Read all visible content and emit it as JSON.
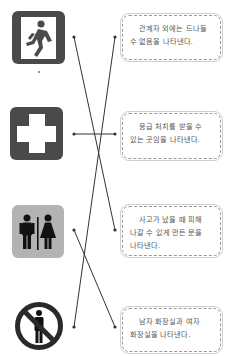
{
  "signs": [
    {
      "name": "emergency-exit",
      "icon": "running-person-exit-icon",
      "bg": "#4a4a4a"
    },
    {
      "name": "first-aid",
      "icon": "white-cross-icon",
      "bg": "#4a4a4a"
    },
    {
      "name": "restroom",
      "icon": "man-woman-restroom-icon",
      "bg": "#b3b3b3"
    },
    {
      "name": "no-entry",
      "icon": "no-entry-person-icon",
      "bg": "#ffffff"
    }
  ],
  "descriptions": [
    {
      "text": "관계자 외에는 드나들 수 없음을 나타낸다."
    },
    {
      "text": "응급 처치를 받을 수 있는 곳임을 나타낸다."
    },
    {
      "text": "사고가 났을 때 피해 나갈 수 있게 만든 문을 나타낸다."
    },
    {
      "text": "남자 화장실과 여자 화장실을 나타낸다."
    }
  ],
  "connections": [
    {
      "from": 1,
      "to": 3
    },
    {
      "from": 2,
      "to": 2
    },
    {
      "from": 3,
      "to": 4
    },
    {
      "from": 4,
      "to": 1
    }
  ],
  "colors": {
    "line": "#333333",
    "box_border": "#9a9a9a",
    "text": "#555555"
  }
}
